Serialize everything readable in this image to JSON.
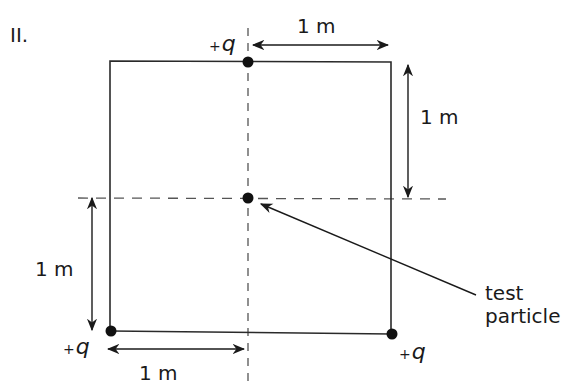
{
  "figure": {
    "label": "II.",
    "colors": {
      "line": "#2a2a2a",
      "dashed": "#555555",
      "dot": "#111111",
      "background": "#ffffff"
    }
  },
  "charges": [
    {
      "id": "top",
      "sign": "+",
      "symbol": "q",
      "position": "top-center"
    },
    {
      "id": "bottom-left",
      "sign": "+",
      "symbol": "q",
      "position": "bottom-left-corner"
    },
    {
      "id": "bottom-right",
      "sign": "+",
      "symbol": "q",
      "position": "bottom-right-corner"
    }
  ],
  "test_particle": {
    "label_line1": "test",
    "label_line2": "particle",
    "position": "center"
  },
  "dimensions": [
    {
      "id": "top-horizontal",
      "label": "1 m"
    },
    {
      "id": "right-vertical",
      "label": "1 m"
    },
    {
      "id": "left-vertical",
      "label": "1 m"
    },
    {
      "id": "bottom-horizontal",
      "label": "1 m"
    }
  ]
}
